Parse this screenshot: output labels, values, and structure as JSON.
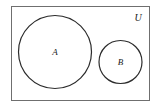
{
  "figure": {
    "type": "venn-diagram",
    "background_color": "#ffffff",
    "stroke_color": "#2b2b2b",
    "text_color": "#1a1a1a"
  },
  "universe": {
    "label": "U",
    "label_x": 138,
    "label_y": 18,
    "rect": {
      "x": 11,
      "y": 6,
      "width": 139,
      "height": 95
    },
    "stroke_color": "#6f6f6f",
    "stroke_width": 1
  },
  "sets": [
    {
      "name": "set-a",
      "label": "A",
      "cx": 55,
      "cy": 52,
      "r": 36.5,
      "label_x": 55,
      "label_y": 53,
      "stroke_color": "#2b2b2b",
      "stroke_width": 1.2,
      "fill": "none"
    },
    {
      "name": "set-b",
      "label": "B",
      "cx": 120.5,
      "cy": 62,
      "r": 21.5,
      "label_x": 120.5,
      "label_y": 63,
      "stroke_color": "#2b2b2b",
      "stroke_width": 1.2,
      "fill": "none"
    }
  ]
}
